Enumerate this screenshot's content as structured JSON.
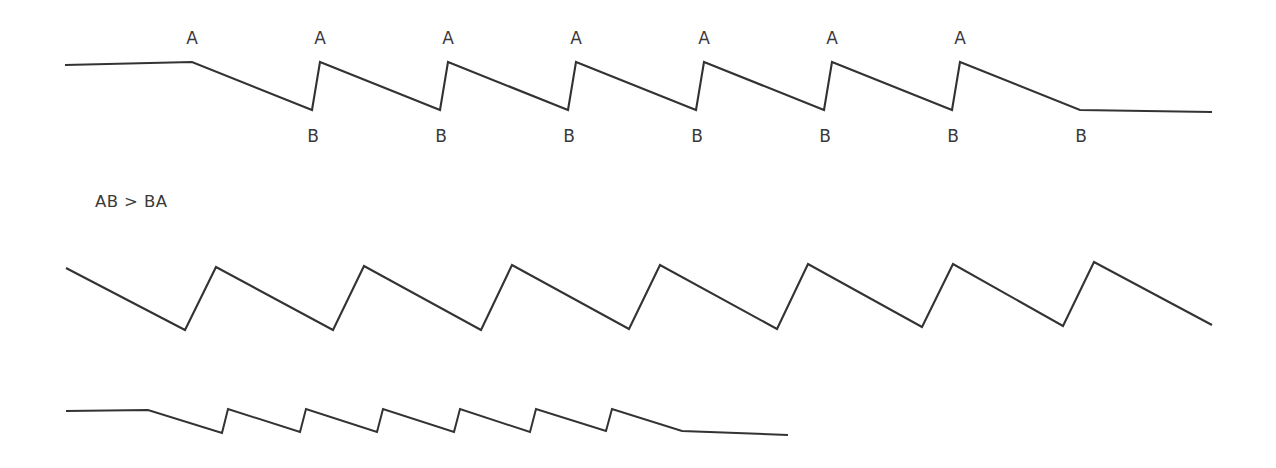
{
  "figure": {
    "background_color": "#ffffff",
    "stroke_color": "#333333",
    "text_color": "#3a3a3a",
    "width": 1276,
    "height": 468
  },
  "annotation": {
    "relation_text": "AB > BA",
    "relation_x": 95,
    "relation_y": 207,
    "label_a": "A",
    "label_b": "B"
  },
  "chart_data": {
    "type": "line",
    "title": "",
    "subtitle": "",
    "xlabel": "",
    "ylabel": "",
    "grid": false,
    "legend": "none",
    "xlim": [
      0,
      1276
    ],
    "ylim": [
      0,
      468
    ],
    "series": [
      {
        "name": "trace-top-zigzag",
        "cycles": 7,
        "period": 128,
        "a_label": "A",
        "b_label": "B",
        "a_label_y": 44,
        "b_label_y": 142,
        "points": [
          [
            65,
            65
          ],
          [
            192,
            62
          ],
          [
            312,
            110
          ],
          [
            320,
            62
          ],
          [
            440,
            110
          ],
          [
            448,
            62
          ],
          [
            568,
            110
          ],
          [
            576,
            62
          ],
          [
            696,
            110
          ],
          [
            704,
            62
          ],
          [
            824,
            110
          ],
          [
            832,
            62
          ],
          [
            952,
            110
          ],
          [
            960,
            62
          ],
          [
            1080,
            110
          ],
          [
            1212,
            112
          ]
        ],
        "a_vertices_x": [
          192,
          320,
          448,
          576,
          704,
          832,
          960
        ],
        "b_vertices_x": [
          312,
          440,
          568,
          696,
          824,
          952,
          1080
        ]
      },
      {
        "name": "trace-middle-sawtooth",
        "cycles": 7,
        "period": 148,
        "points": [
          [
            66,
            268
          ],
          [
            185,
            330
          ],
          [
            216,
            267
          ],
          [
            333,
            330
          ],
          [
            364,
            266
          ],
          [
            481,
            330
          ],
          [
            512,
            265
          ],
          [
            629,
            329
          ],
          [
            660,
            265
          ],
          [
            777,
            329
          ],
          [
            808,
            264
          ],
          [
            922,
            327
          ],
          [
            953,
            264
          ],
          [
            1063,
            326
          ],
          [
            1094,
            262
          ],
          [
            1212,
            325
          ]
        ],
        "trough_x": [
          185,
          333,
          481,
          629,
          777,
          922,
          1063
        ],
        "peak_x": [
          216,
          364,
          512,
          660,
          808,
          953,
          1094
        ]
      },
      {
        "name": "trace-bottom-compressed-zigzag",
        "cycles": 7,
        "period": 75,
        "points": [
          [
            66,
            411
          ],
          [
            148,
            410
          ],
          [
            222,
            433
          ],
          [
            228,
            409
          ],
          [
            300,
            432
          ],
          [
            306,
            409
          ],
          [
            377,
            432
          ],
          [
            383,
            409
          ],
          [
            454,
            432
          ],
          [
            460,
            409
          ],
          [
            530,
            432
          ],
          [
            536,
            409
          ],
          [
            606,
            431
          ],
          [
            612,
            409
          ],
          [
            682,
            431
          ],
          [
            788,
            435
          ]
        ]
      }
    ]
  }
}
